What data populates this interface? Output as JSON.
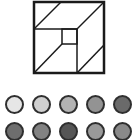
{
  "diagram": {
    "outer_square": {
      "x": 34,
      "y": 2,
      "w": 70,
      "h": 71
    },
    "inner_square": {
      "x": 62,
      "y": 29,
      "w": 15,
      "h": 15
    },
    "lines": [
      {
        "x1": 34,
        "y1": 29,
        "x2": 61,
        "y2": 2
      },
      {
        "x1": 34,
        "y1": 29,
        "x2": 77,
        "y2": 29
      },
      {
        "x1": 77,
        "y1": 29,
        "x2": 104,
        "y2": 2
      },
      {
        "x1": 77,
        "y1": 29,
        "x2": 77,
        "y2": 73
      },
      {
        "x1": 62,
        "y1": 44,
        "x2": 34,
        "y2": 73
      },
      {
        "x1": 77,
        "y1": 73,
        "x2": 104,
        "y2": 45
      }
    ],
    "stroke_color": "#1a1a1a"
  },
  "swatches": {
    "row1": [
      "#e6e6e6",
      "#cfcfcf",
      "#b3b3b3",
      "#939393",
      "#6a6a6a"
    ],
    "row2": [
      "#6e6e6e",
      "#828282",
      "#565656",
      "#9a9a9a",
      "#8a8a8a"
    ],
    "centers_x": [
      15,
      42,
      69,
      96,
      123
    ],
    "row1_center_y": 105,
    "row2_center_y": 132
  }
}
